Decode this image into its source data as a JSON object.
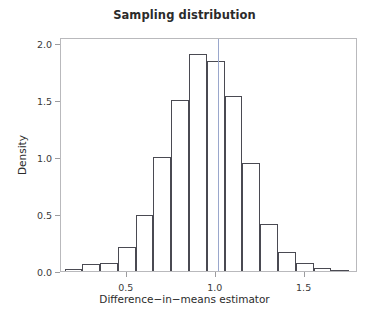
{
  "chart_data": {
    "type": "bar",
    "title": "Sampling distribution",
    "xlabel": "Difference−in−means estimator",
    "ylabel": "Density",
    "xlim": [
      0.13,
      1.8
    ],
    "ylim": [
      0.0,
      2.05
    ],
    "xticks": [
      0.5,
      1.0,
      1.5
    ],
    "xtick_labels": [
      "0.5",
      "1.0",
      "1.5"
    ],
    "yticks": [
      0.0,
      0.5,
      1.0,
      1.5,
      2.0
    ],
    "ytick_labels": [
      "0.0",
      "0.5",
      "1.0",
      "1.5",
      "2.0"
    ],
    "grid": false,
    "legend": false,
    "bin_width": 0.1,
    "bin_edges": [
      0.15,
      0.25,
      0.35,
      0.45,
      0.55,
      0.65,
      0.75,
      0.85,
      0.95,
      1.05,
      1.15,
      1.25,
      1.35,
      1.45,
      1.55,
      1.65,
      1.75
    ],
    "categories": [
      "0.15-0.25",
      "0.25-0.35",
      "0.35-0.45",
      "0.45-0.55",
      "0.55-0.65",
      "0.65-0.75",
      "0.75-0.85",
      "0.85-0.95",
      "0.95-1.05",
      "1.05-1.15",
      "1.15-1.25",
      "1.25-1.35",
      "1.35-1.45",
      "1.45-1.55",
      "1.55-1.65",
      "1.65-1.75"
    ],
    "values": [
      0.02,
      0.06,
      0.07,
      0.21,
      0.49,
      1.0,
      1.5,
      1.9,
      1.84,
      1.53,
      0.95,
      0.41,
      0.17,
      0.07,
      0.03,
      0.01
    ],
    "annotations": [
      {
        "name": "true-value-reference-line",
        "type": "vline",
        "x": 1.01,
        "color": "#9aa7cc"
      }
    ],
    "bar_edge_color": "#4a4a52",
    "bar_fill_color": "none",
    "frame_color": "#b9b9bc",
    "background_color": "#ffffff"
  }
}
